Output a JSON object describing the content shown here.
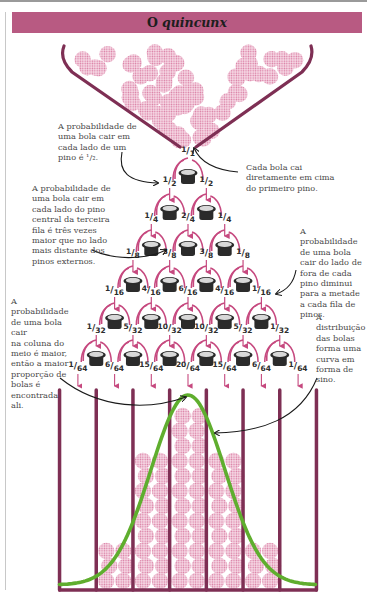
{
  "title": {
    "prefix": "O",
    "emphasis": "quincunx"
  },
  "colors": {
    "title_bar": "#b85a82",
    "structure": "#7e2f54",
    "ball": "#e8a6c3",
    "arrow_pink": "#c6497f",
    "bell_curve": "#5fae2e",
    "pin_dark": "#2b2b2b",
    "pin_light": "#d8d8d8",
    "text": "#4a4a4a"
  },
  "annotations": {
    "half_each_side": "A probabilidade de uma bola cair em cada lado de um pino é ½.",
    "half_each_side_lines": [
      "A probabilidade de",
      "uma bola cair em",
      "cada lado de um",
      "pino é ¹/₂."
    ],
    "first_pin": "Cada bola cai diretamente em cima do primeiro pino.",
    "first_pin_lines": [
      "Cada bola cai",
      "diretamente em cima",
      "do primeiro pino."
    ],
    "three_times": "A probabilidade de uma bola cair em cada lado do pino central da terceira fila é três vezes maior que no lado mais distante dos pinos externos.",
    "three_times_lines": [
      "A probabilidade de",
      "uma bola cair em",
      "cada lado do pino",
      "central da terceira",
      "fila é três vezes",
      "maior que no lado",
      "mais distante dos",
      "pinos externos."
    ],
    "halves_outside": "A probabilidade de uma bola cair do lado de fora de cada pino diminui para a metade a cada fila de pinos.",
    "halves_outside_lines": [
      "A probabilidade",
      "de uma bola",
      "cair do lado de",
      "fora de cada",
      "pino diminui",
      "para a metade",
      "a cada fila de",
      "pinos."
    ],
    "middle_column": "A probabilidade de uma bola cair na coluna do meio é maior, então a maior proporção de bolas é encontrada ali.",
    "middle_column_lines": [
      "A probabilidade",
      "de uma bola cair",
      "na coluna do",
      "meio é maior,",
      "então a maior",
      "proporção de",
      "bolas é",
      "encontrada",
      "ali."
    ],
    "bell_shape": "A distribuição das bolas forma uma curva em forma de sino.",
    "bell_shape_lines": [
      "A",
      "distribuição",
      "das bolas",
      "forma uma",
      "curva em",
      "forma de",
      "sino."
    ]
  },
  "rows": [
    {
      "labels": [
        {
          "n": "1",
          "d": "1"
        }
      ]
    },
    {
      "labels": [
        {
          "n": "1",
          "d": "2"
        },
        {
          "n": "1",
          "d": "2"
        }
      ]
    },
    {
      "labels": [
        {
          "n": "1",
          "d": "4"
        },
        {
          "n": "2",
          "d": "4"
        },
        {
          "n": "1",
          "d": "4"
        }
      ]
    },
    {
      "labels": [
        {
          "n": "1",
          "d": "8"
        },
        {
          "n": "3",
          "d": "8"
        },
        {
          "n": "3",
          "d": "8"
        },
        {
          "n": "1",
          "d": "8"
        }
      ]
    },
    {
      "labels": [
        {
          "n": "1",
          "d": "16"
        },
        {
          "n": "4",
          "d": "16"
        },
        {
          "n": "6",
          "d": "16"
        },
        {
          "n": "4",
          "d": "16"
        },
        {
          "n": "1",
          "d": "16"
        }
      ]
    },
    {
      "labels": [
        {
          "n": "1",
          "d": "32"
        },
        {
          "n": "5",
          "d": "32"
        },
        {
          "n": "10",
          "d": "32"
        },
        {
          "n": "10",
          "d": "32"
        },
        {
          "n": "5",
          "d": "32"
        },
        {
          "n": "1",
          "d": "32"
        }
      ]
    },
    {
      "labels": [
        {
          "n": "1",
          "d": "64"
        },
        {
          "n": "6",
          "d": "64"
        },
        {
          "n": "15",
          "d": "64"
        },
        {
          "n": "20",
          "d": "64"
        },
        {
          "n": "15",
          "d": "64"
        },
        {
          "n": "6",
          "d": "64"
        },
        {
          "n": "1",
          "d": "64"
        }
      ]
    }
  ],
  "bins": {
    "count": 7,
    "probabilities": [
      "1/64",
      "6/64",
      "15/64",
      "20/64",
      "15/64",
      "6/64",
      "1/64"
    ]
  },
  "icons": {
    "pin": "pin-icon",
    "ball": "ball-icon",
    "funnel": "funnel-icon",
    "bell_curve": "bell-curve-icon",
    "arrow": "arrow-icon"
  }
}
